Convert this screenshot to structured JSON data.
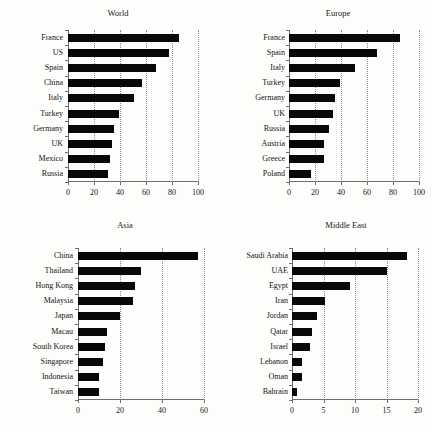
{
  "figure": {
    "background": "#fdfdfb",
    "bar_color": "#080808",
    "axis_color": "#6e6e6e",
    "grid_color": "#8c8c8c",
    "panel_count": 4,
    "layout": "2x2"
  },
  "chart_data": [
    {
      "type": "bar",
      "orientation": "horizontal",
      "title": "World",
      "xlabel": "",
      "ylabel": "",
      "categories": [
        "France",
        "US",
        "Spain",
        "China",
        "Italy",
        "Turkey",
        "Germany",
        "UK",
        "Mexico",
        "Russia"
      ],
      "values": [
        85,
        78,
        68,
        57,
        51,
        39,
        35,
        34,
        32,
        31
      ],
      "xlim": [
        0,
        100
      ],
      "xticks": [
        0,
        20,
        40,
        60,
        80,
        100
      ],
      "xticklabels": [
        "0",
        "20",
        "40",
        "60",
        "80",
        "100"
      ],
      "grid": "vertical-dotted",
      "legend": "none"
    },
    {
      "type": "bar",
      "orientation": "horizontal",
      "title": "Europe",
      "xlabel": "",
      "ylabel": "",
      "categories": [
        "France",
        "Spain",
        "Italy",
        "Turkey",
        "Germany",
        "UK",
        "Russia",
        "Austria",
        "Greece",
        "Poland"
      ],
      "values": [
        85,
        68,
        51,
        39,
        35,
        34,
        31,
        27,
        27,
        17
      ],
      "xlim": [
        0,
        100
      ],
      "xticks": [
        0,
        20,
        40,
        60,
        80,
        100
      ],
      "xticklabels": [
        "0",
        "20",
        "40",
        "60",
        "80",
        "100"
      ],
      "grid": "vertical-dotted",
      "legend": "none"
    },
    {
      "type": "bar",
      "orientation": "horizontal",
      "title": "Asia",
      "xlabel": "",
      "ylabel": "",
      "categories": [
        "China",
        "Thailand",
        "Hong Kong",
        "Malaysia",
        "Japan",
        "Macau",
        "South Korea",
        "Singapore",
        "Indonesia",
        "Taiwan"
      ],
      "values": [
        57,
        30,
        27,
        26,
        20,
        14,
        13,
        12,
        10,
        10
      ],
      "xlim": [
        0,
        60
      ],
      "xticks": [
        0,
        20,
        40,
        60
      ],
      "xticklabels": [
        "0",
        "20",
        "40",
        "60"
      ],
      "grid": "vertical-dotted",
      "legend": "none"
    },
    {
      "type": "bar",
      "orientation": "horizontal",
      "title": "Middle East",
      "xlabel": "",
      "ylabel": "",
      "categories": [
        "Saudi Arabia",
        "UAE",
        "Egypt",
        "Iran",
        "Jordan",
        "Qatar",
        "Israel",
        "Lebanon",
        "Oman",
        "Bahrain"
      ],
      "values": [
        18.2,
        15.0,
        9.2,
        5.2,
        4.0,
        3.1,
        2.9,
        1.6,
        1.6,
        0.8
      ],
      "xlim": [
        0,
        20
      ],
      "xticks": [
        0,
        5,
        10,
        15,
        20
      ],
      "xticklabels": [
        "0",
        "5",
        "10",
        "15",
        "20"
      ],
      "grid": "vertical-dotted",
      "legend": "none"
    }
  ]
}
